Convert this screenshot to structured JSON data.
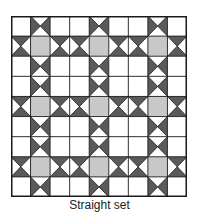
{
  "figure": {
    "caption": "Straight set",
    "grid": {
      "rows": 9,
      "cols": 9
    },
    "colors": {
      "background": "#ffffff",
      "dark": "#5a5a5a",
      "light_square": "#c8c8c8",
      "line": "#1a1a1a"
    },
    "cell_types": {
      "W": "white-square",
      "V": "hourglass-vertical-dark-left-right",
      "H": "hourglass-horizontal-dark-top-bottom",
      "G": "gray-square"
    },
    "layout": [
      [
        "W",
        "V",
        "W",
        "W",
        "V",
        "W",
        "W",
        "V",
        "W"
      ],
      [
        "H",
        "G",
        "H",
        "H",
        "G",
        "H",
        "H",
        "G",
        "H"
      ],
      [
        "W",
        "V",
        "W",
        "W",
        "V",
        "W",
        "W",
        "V",
        "W"
      ],
      [
        "W",
        "V",
        "W",
        "W",
        "V",
        "W",
        "W",
        "V",
        "W"
      ],
      [
        "H",
        "G",
        "H",
        "H",
        "G",
        "H",
        "H",
        "G",
        "H"
      ],
      [
        "W",
        "V",
        "W",
        "W",
        "V",
        "W",
        "W",
        "V",
        "W"
      ],
      [
        "W",
        "V",
        "W",
        "W",
        "V",
        "W",
        "W",
        "V",
        "W"
      ],
      [
        "H",
        "G",
        "H",
        "H",
        "G",
        "H",
        "H",
        "G",
        "H"
      ],
      [
        "W",
        "V",
        "W",
        "W",
        "V",
        "W",
        "W",
        "V",
        "W"
      ]
    ]
  }
}
